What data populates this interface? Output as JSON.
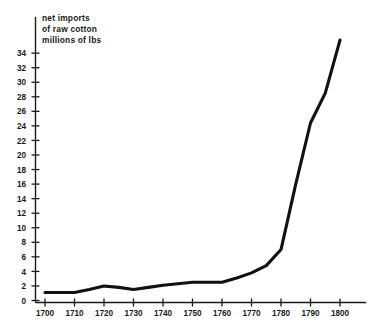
{
  "chart_data": {
    "type": "line",
    "title": "net imports of raw cotton millions of lbs",
    "title_lines": [
      "net imports",
      "of raw cotton",
      "millions of lbs"
    ],
    "xlabel": "",
    "ylabel": "",
    "xlim": [
      1695,
      1805
    ],
    "ylim": [
      0,
      35
    ],
    "grid": false,
    "legend": null,
    "x_tick_labels": [
      "1700",
      "1710",
      "1720",
      "1730",
      "1740",
      "1750",
      "1760",
      "1770",
      "1780",
      "1790",
      "1800"
    ],
    "x_ticks": [
      1700,
      1710,
      1720,
      1730,
      1740,
      1750,
      1760,
      1770,
      1780,
      1790,
      1800
    ],
    "y_tick_labels": [
      "0",
      "2",
      "4",
      "6",
      "8",
      "10",
      "12",
      "14",
      "16",
      "18",
      "20",
      "22",
      "24",
      "26",
      "28",
      "30",
      "32",
      "34"
    ],
    "y_ticks": [
      0,
      2,
      4,
      6,
      8,
      10,
      12,
      14,
      16,
      18,
      20,
      22,
      24,
      26,
      28,
      30,
      32,
      34
    ],
    "series": [
      {
        "name": "net imports of raw cotton",
        "units": "millions of lbs",
        "color": "#111111",
        "x": [
          1700,
          1710,
          1715,
          1720,
          1725,
          1730,
          1735,
          1740,
          1745,
          1750,
          1755,
          1760,
          1765,
          1770,
          1775,
          1780,
          1785,
          1790,
          1795,
          1800
        ],
        "values": [
          1.1,
          1.1,
          1.5,
          2.0,
          1.8,
          1.5,
          1.8,
          2.1,
          2.3,
          2.5,
          2.5,
          2.5,
          3.1,
          3.8,
          4.8,
          7.0,
          16.0,
          24.4,
          28.5,
          35.8
        ]
      }
    ]
  },
  "figure": {
    "background_color": "#ffffff",
    "axis_color": "#1a1a1a",
    "line_color": "#111111"
  }
}
